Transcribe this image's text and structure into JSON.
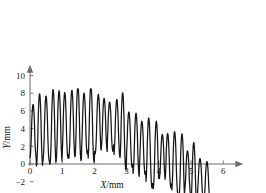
{
  "chart_data": {
    "type": "line",
    "title": "",
    "subtitle": "",
    "xlabel": "X/mm",
    "ylabel": "Y/mm",
    "xlabel_symbol": "X",
    "xlabel_unit": "/mm",
    "ylabel_symbol": "Y",
    "ylabel_unit": "/mm",
    "xlim": [
      0,
      6.5
    ],
    "ylim": [
      -6,
      11
    ],
    "xticks": [
      0,
      1,
      2,
      3,
      4,
      5,
      6
    ],
    "xtick_labels": [
      "0",
      "1",
      "2",
      "3",
      "4",
      "5",
      "6"
    ],
    "yticks": [
      -6,
      -4,
      -2,
      0,
      2,
      4,
      6,
      8,
      10
    ],
    "ytick_labels": [
      "-6",
      "-4",
      "-2",
      "0",
      "2",
      "4",
      "6",
      "8",
      "10"
    ],
    "grid": false,
    "legend": null,
    "legend_position": "none",
    "axis_style": "arrow-axes",
    "line_color": "#151515",
    "axis_color": "#6b6b6b",
    "series": [
      {
        "name": "surface profile",
        "x_start": 0.0,
        "x_end": 5.62,
        "n_points": 561,
        "description": "Oscillating roughness profile: ~28 cycles of period ~0.2 mm, amplitude ~3.3 mm, riding on a mean level that holds near 4 mm until x~2.8 then declines to about -1.5 mm by x~5.6",
        "x": [
          0.0,
          0.1,
          0.2,
          0.3,
          0.4,
          0.5,
          0.6,
          0.7,
          0.8,
          0.9,
          1.0,
          1.1,
          1.2,
          1.3,
          1.4,
          1.5,
          1.6,
          1.7,
          1.8,
          1.9,
          2.0,
          2.1,
          2.2,
          2.3,
          2.4,
          2.5,
          2.6,
          2.7,
          2.8,
          2.9,
          3.0,
          3.1,
          3.2,
          3.3,
          3.4,
          3.5,
          3.6,
          3.7,
          3.8,
          3.9,
          4.0,
          4.1,
          4.2,
          4.3,
          4.4,
          4.5,
          4.6,
          4.7,
          4.8,
          4.9,
          5.0,
          5.1,
          5.2,
          5.3,
          5.4,
          5.5,
          5.6
        ],
        "y": [
          4.6,
          0.05,
          6.0,
          1.3,
          6.1,
          0.65,
          8.2,
          0.75,
          5.9,
          4.05,
          0.0,
          7.2,
          1.1,
          8.2,
          2.2,
          7.35,
          2.6,
          7.6,
          1.3,
          7.0,
          2.4,
          6.4,
          2.15,
          7.2,
          1.25,
          8.3,
          1.2,
          6.0,
          0.45,
          4.85,
          1.0,
          3.0,
          -1.95,
          5.05,
          -0.75,
          5.2,
          -3.3,
          3.35,
          -2.55,
          4.3,
          -1.25,
          2.55,
          -3.1,
          4.05,
          -2.05,
          4.05,
          -1.8,
          2.4,
          -5.6,
          0.2,
          -5.85,
          -1.9,
          -4.55,
          -1.7,
          -4.35,
          -1.65,
          -4.1
        ],
        "peaks_y_max": 8.4,
        "troughs_y_min": -5.9
      }
    ],
    "envelope": {
      "mean_knots_x": [
        0.0,
        0.8,
        1.5,
        2.2,
        2.8,
        3.3,
        3.9,
        4.5,
        5.0,
        5.6
      ],
      "mean_knots_y": [
        3.7,
        4.2,
        4.6,
        4.5,
        4.0,
        2.2,
        1.0,
        0.2,
        -1.1,
        -2.0
      ],
      "amplitude_knots_x": [
        0.0,
        1.0,
        2.0,
        3.0,
        4.0,
        5.0,
        5.6
      ],
      "amplitude_knots_y": [
        3.2,
        3.6,
        3.5,
        3.4,
        3.2,
        3.0,
        2.6
      ],
      "period_mm": 0.2,
      "cycles": 28
    }
  },
  "figure": {
    "background_color": "#ffffff",
    "width_px": 266,
    "height_px": 193
  }
}
